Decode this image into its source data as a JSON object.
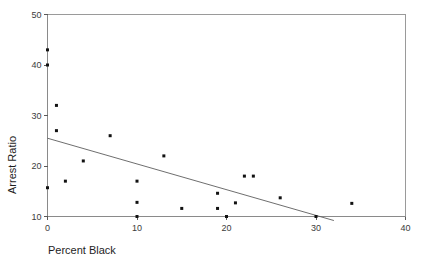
{
  "figure": {
    "clipped_caption_fragment": "",
    "background_color": "#ffffff",
    "point_color": "#121212",
    "line_color": "#5e5e5e",
    "axis_color": "#8a8a8a"
  },
  "chart_data": {
    "type": "scatter",
    "title": "",
    "xlabel": "Percent Black",
    "ylabel": "Arrest Ratio",
    "xlim": [
      0,
      40
    ],
    "ylim": [
      10,
      50
    ],
    "xticks": [
      0,
      10,
      20,
      30,
      40
    ],
    "xtick_labels": [
      "0",
      "10",
      "20",
      "30",
      "40"
    ],
    "yticks": [
      10,
      20,
      30,
      40,
      50
    ],
    "ytick_labels": [
      "10",
      "20",
      "30",
      "40",
      "50"
    ],
    "grid": false,
    "legend": null,
    "points": [
      {
        "x": 0.0,
        "y": 43.0
      },
      {
        "x": 0.0,
        "y": 40.0
      },
      {
        "x": 1.0,
        "y": 32.0
      },
      {
        "x": 1.0,
        "y": 27.0
      },
      {
        "x": 0.0,
        "y": 15.7
      },
      {
        "x": 2.0,
        "y": 17.0
      },
      {
        "x": 4.0,
        "y": 21.0
      },
      {
        "x": 7.0,
        "y": 26.0
      },
      {
        "x": 10.0,
        "y": 17.0
      },
      {
        "x": 10.0,
        "y": 12.8
      },
      {
        "x": 10.0,
        "y": 10.0
      },
      {
        "x": 13.0,
        "y": 22.0
      },
      {
        "x": 15.0,
        "y": 11.6
      },
      {
        "x": 19.0,
        "y": 14.6
      },
      {
        "x": 19.0,
        "y": 11.6
      },
      {
        "x": 20.0,
        "y": 10.0
      },
      {
        "x": 21.0,
        "y": 12.7
      },
      {
        "x": 22.0,
        "y": 18.0
      },
      {
        "x": 23.0,
        "y": 18.0
      },
      {
        "x": 26.0,
        "y": 13.7
      },
      {
        "x": 30.0,
        "y": 10.0
      },
      {
        "x": 34.0,
        "y": 12.6
      }
    ],
    "fit_line": {
      "label": "regression line",
      "x_start": 0.0,
      "y_start": 25.5,
      "x_end": 32.0,
      "y_end": 9.2
    }
  }
}
